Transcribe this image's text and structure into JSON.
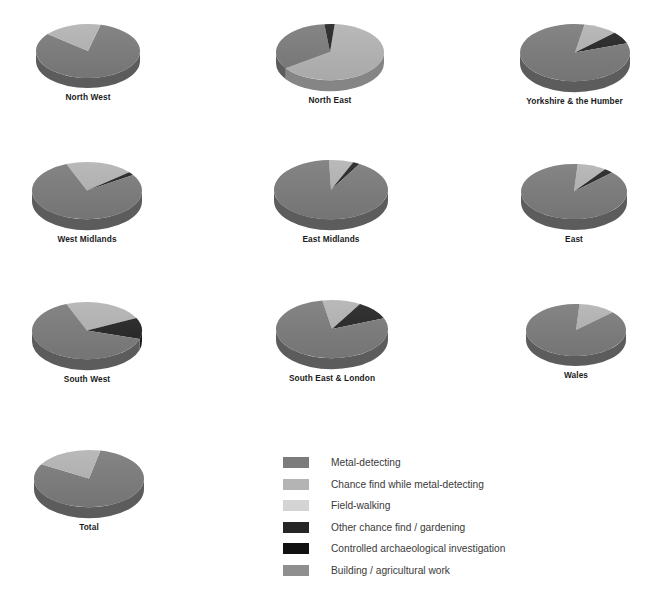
{
  "chart_data": {
    "type": "pie",
    "title": "",
    "xlabel": "",
    "ylabel": "",
    "grid": false,
    "legend_position": "bottom-right",
    "legend": [
      {
        "label": "Metal-detecting",
        "color": "#7c7c7c"
      },
      {
        "label": "Chance find while metal-detecting",
        "color": "#b4b4b4"
      },
      {
        "label": "Field-walking",
        "color": "#d4d4d4"
      },
      {
        "label": "Other chance find / gardening",
        "color": "#262626"
      },
      {
        "label": "Controlled archaeological investigation",
        "color": "#111111"
      },
      {
        "label": "Building / agricultural work",
        "color": "#8f8f8f"
      }
    ],
    "categories": [
      "Metal-detecting",
      "Chance find while metal-detecting",
      "Field-walking",
      "Other chance find / gardening",
      "Controlled archaeological investigation",
      "Building / agricultural work"
    ],
    "series": [
      {
        "name": "North West",
        "values": [
          82,
          18,
          0,
          0,
          0,
          0
        ]
      },
      {
        "name": "North East",
        "values": [
          33,
          64,
          0,
          3,
          0,
          0
        ]
      },
      {
        "name": "Yorkshire & the Humber",
        "values": [
          83,
          10,
          0,
          7,
          0,
          0
        ]
      },
      {
        "name": "West Midlands",
        "values": [
          78,
          20,
          0,
          2,
          0,
          0
        ]
      },
      {
        "name": "East Midlands",
        "values": [
          91,
          7,
          0,
          2,
          0,
          0
        ]
      },
      {
        "name": "East",
        "values": [
          88,
          9,
          0,
          3,
          0,
          0
        ]
      },
      {
        "name": "South West",
        "values": [
          64,
          24,
          0,
          12,
          0,
          0
        ]
      },
      {
        "name": "South East & London",
        "values": [
          78,
          11,
          0,
          11,
          0,
          0
        ]
      },
      {
        "name": "Wales",
        "values": [
          88,
          12,
          0,
          0,
          0,
          0
        ]
      },
      {
        "name": "Total",
        "values": [
          80,
          20,
          0,
          0,
          0,
          0
        ]
      }
    ]
  },
  "pies": [
    {
      "label": "North West",
      "x": 32,
      "y": 22,
      "w": 112,
      "radius": 52,
      "start": -76,
      "slices": [
        {
          "c": 0,
          "sweep": 295
        },
        {
          "c": 1,
          "sweep": 65
        }
      ]
    },
    {
      "label": "North East",
      "x": 272,
      "y": 22,
      "w": 116,
      "radius": 54,
      "start": -85,
      "slices": [
        {
          "c": 1,
          "sweep": 230
        },
        {
          "c": 0,
          "sweep": 119
        },
        {
          "c": 3,
          "sweep": 11
        }
      ]
    },
    {
      "label": "Yorkshire & the Humber",
      "x": 515,
      "y": 22,
      "w": 119,
      "radius": 55,
      "start": -80,
      "slices": [
        {
          "c": 1,
          "sweep": 36
        },
        {
          "c": 3,
          "sweep": 25
        },
        {
          "c": 0,
          "sweep": 299
        }
      ]
    },
    {
      "label": "West Midlands",
      "x": 28,
      "y": 160,
      "w": 118,
      "radius": 55,
      "start": -112,
      "slices": [
        {
          "c": 1,
          "sweep": 72
        },
        {
          "c": 3,
          "sweep": 7
        },
        {
          "c": 0,
          "sweep": 281
        }
      ]
    },
    {
      "label": "East Midlands",
      "x": 270,
      "y": 158,
      "w": 122,
      "radius": 57,
      "start": -92,
      "slices": [
        {
          "c": 1,
          "sweep": 25
        },
        {
          "c": 3,
          "sweep": 7
        },
        {
          "c": 0,
          "sweep": 328
        }
      ]
    },
    {
      "label": "East",
      "x": 517,
      "y": 162,
      "w": 114,
      "radius": 53,
      "start": -86,
      "slices": [
        {
          "c": 1,
          "sweep": 32
        },
        {
          "c": 3,
          "sweep": 10
        },
        {
          "c": 0,
          "sweep": 318
        }
      ]
    },
    {
      "label": "South West",
      "x": 28,
      "y": 300,
      "w": 118,
      "radius": 55,
      "start": -112,
      "slices": [
        {
          "c": 1,
          "sweep": 86
        },
        {
          "c": 3,
          "sweep": 43
        },
        {
          "c": 0,
          "sweep": 231
        }
      ]
    },
    {
      "label": "South East & London",
      "x": 272,
      "y": 298,
      "w": 120,
      "radius": 56,
      "start": -100,
      "slices": [
        {
          "c": 1,
          "sweep": 40
        },
        {
          "c": 3,
          "sweep": 38
        },
        {
          "c": 0,
          "sweep": 282
        }
      ]
    },
    {
      "label": "Wales",
      "x": 522,
      "y": 302,
      "w": 108,
      "radius": 50,
      "start": -86,
      "slices": [
        {
          "c": 1,
          "sweep": 43
        },
        {
          "c": 0,
          "sweep": 317
        }
      ]
    },
    {
      "label": "Total",
      "x": 30,
      "y": 448,
      "w": 118,
      "radius": 55,
      "start": -78,
      "slices": [
        {
          "c": 0,
          "sweep": 288
        },
        {
          "c": 1,
          "sweep": 72
        }
      ]
    }
  ]
}
